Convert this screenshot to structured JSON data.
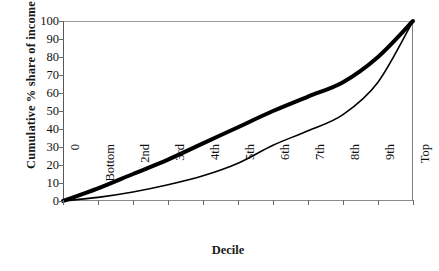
{
  "chart_data": {
    "type": "line",
    "title": "",
    "xlabel": "Decile",
    "ylabel": "Cumulative % share of income",
    "xlim": [
      0,
      10
    ],
    "ylim": [
      0,
      100
    ],
    "grid": false,
    "legend_position": "none",
    "x": [
      0,
      1,
      2,
      3,
      4,
      5,
      6,
      7,
      8,
      9,
      10
    ],
    "categories": [
      "0",
      "Bottom",
      "2nd",
      "3rd",
      "4th",
      "5th",
      "6th",
      "7th",
      "8th",
      "9th",
      "Top"
    ],
    "xtick_labels": [
      "0",
      "Bottom",
      "2nd",
      "3rd",
      "4th",
      "5th",
      "6th",
      "7th",
      "8th",
      "9th",
      "Top"
    ],
    "ytick_labels": [
      "0",
      "10",
      "20",
      "30",
      "40",
      "50",
      "60",
      "70",
      "80",
      "90",
      "100"
    ],
    "ytick_values": [
      0,
      10,
      20,
      30,
      40,
      50,
      60,
      70,
      80,
      90,
      100
    ],
    "series": [
      {
        "name": "More equal distribution",
        "style": "thick",
        "color": "#000000",
        "linewidth": 4,
        "values": [
          0,
          7,
          15,
          23,
          32,
          41,
          50,
          58,
          66,
          80,
          100
        ]
      },
      {
        "name": "Lorenz curve",
        "style": "thin",
        "color": "#000000",
        "linewidth": 1.6,
        "values": [
          0,
          2,
          5,
          9,
          14,
          21,
          31,
          39,
          48,
          66,
          100
        ]
      }
    ]
  },
  "axes": {
    "x_title": "Decile",
    "y_title": "Cumulative % share of income"
  }
}
